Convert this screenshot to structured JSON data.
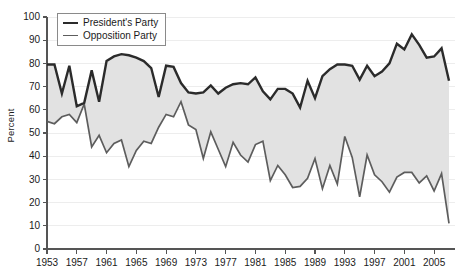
{
  "chart_data": {
    "type": "area",
    "title": "",
    "subtitle": "",
    "xlabel": "",
    "ylabel": "Percent",
    "ylim": [
      0,
      100
    ],
    "xlim": [
      1953,
      2007
    ],
    "ytick_step": 10,
    "yticks": [
      0,
      10,
      20,
      30,
      40,
      50,
      60,
      70,
      80,
      90,
      100
    ],
    "xticks": [
      1953,
      1957,
      1961,
      1965,
      1969,
      1973,
      1977,
      1981,
      1985,
      1989,
      1993,
      1997,
      2001,
      2005
    ],
    "grid": "horizontal",
    "legend_position": "top-left",
    "fill_between_series": true,
    "fill_color": "#e2e2e2",
    "x": [
      1953,
      1954,
      1955,
      1956,
      1957,
      1958,
      1959,
      1960,
      1961,
      1962,
      1963,
      1964,
      1965,
      1966,
      1967,
      1968,
      1969,
      1970,
      1971,
      1972,
      1973,
      1974,
      1975,
      1976,
      1977,
      1978,
      1979,
      1980,
      1981,
      1982,
      1983,
      1984,
      1985,
      1986,
      1987,
      1988,
      1989,
      1990,
      1991,
      1992,
      1993,
      1994,
      1995,
      1996,
      1997,
      1998,
      1999,
      2000,
      2001,
      2002,
      2003,
      2004,
      2005,
      2006,
      2007
    ],
    "series": [
      {
        "name": "President's Party",
        "color": "#2b2b2b",
        "line_width": 2.4,
        "values": [
          79.5,
          79.5,
          67.0,
          79.0,
          61.5,
          63.0,
          77.0,
          63.5,
          81.0,
          83.0,
          84.0,
          83.5,
          82.5,
          81.0,
          78.0,
          65.5,
          79.0,
          78.5,
          71.5,
          67.5,
          67.0,
          67.5,
          70.5,
          67.0,
          69.5,
          71.0,
          71.5,
          71.0,
          74.0,
          68.0,
          64.5,
          69.0,
          69.0,
          67.0,
          61.0,
          72.5,
          65.0,
          74.5,
          77.5,
          79.5,
          79.5,
          79.0,
          73.0,
          79.0,
          74.5,
          76.5,
          80.0,
          88.5,
          86.0,
          92.5,
          88.0,
          82.5,
          83.0,
          86.5,
          72.5
        ]
      },
      {
        "name": "Opposition Party",
        "color": "#5d5d5d",
        "line_width": 1.7,
        "values": [
          55.0,
          54.0,
          57.0,
          58.0,
          54.5,
          62.5,
          44.0,
          49.0,
          41.5,
          45.5,
          47.0,
          35.5,
          42.5,
          46.5,
          45.5,
          52.5,
          58.0,
          57.0,
          63.5,
          53.5,
          51.5,
          39.0,
          50.5,
          43.0,
          35.5,
          46.0,
          40.5,
          37.5,
          45.0,
          46.5,
          29.5,
          36.0,
          32.0,
          26.5,
          27.0,
          30.5,
          39.0,
          26.0,
          36.0,
          28.0,
          48.5,
          39.5,
          22.5,
          40.5,
          32.0,
          29.0,
          24.5,
          31.0,
          33.0,
          33.0,
          28.5,
          31.5,
          25.0,
          32.5,
          11.0
        ]
      }
    ]
  },
  "legend": {
    "items": [
      {
        "label": "President's Party",
        "style": "thick"
      },
      {
        "label": "Opposition Party",
        "style": "thin"
      }
    ]
  },
  "axes": {
    "y_title": "Percent"
  },
  "colors": {
    "presidents_party": "#2b2b2b",
    "opposition_party": "#5d5d5d",
    "band_fill": "#e2e2e2",
    "gridline": "#ededed",
    "axis": "#555555",
    "background": "#ffffff"
  }
}
